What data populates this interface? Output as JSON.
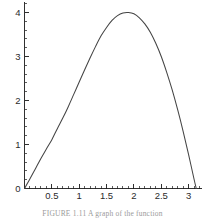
{
  "figure": {
    "caption": "FIGURE 1.11  A graph of the function"
  },
  "chart_data": {
    "type": "line",
    "title": "",
    "subtitle": "",
    "xlabel": "",
    "ylabel": "",
    "grid": false,
    "legend": null,
    "legend_position": "none",
    "line_color": "#444444",
    "axis_color": "#1a1a1a",
    "xlim": [
      0,
      3.25
    ],
    "ylim": [
      0,
      4.25
    ],
    "x_major_ticks": [
      0.5,
      1,
      1.5,
      2,
      2.5,
      3
    ],
    "x_major_tick_labels": [
      "0.5",
      "1",
      "1.5",
      "2",
      "2.5",
      "3"
    ],
    "x_minor_tick_step": 0.1,
    "y_major_ticks": [
      0,
      1,
      2,
      3,
      4
    ],
    "y_major_tick_labels": [
      "0",
      "1",
      "2",
      "3",
      "4"
    ],
    "y_minor_tick_step": 0.2,
    "origin_label": "0",
    "peak": {
      "x": 1.9,
      "y": 4.0
    },
    "zeros": [
      0.0,
      3.14
    ],
    "x": [
      0.0,
      0.1,
      0.2,
      0.3,
      0.4,
      0.5,
      0.6,
      0.7,
      0.8,
      0.9,
      1.0,
      1.1,
      1.2,
      1.3,
      1.4,
      1.5,
      1.6,
      1.7,
      1.8,
      1.9,
      2.0,
      2.1,
      2.2,
      2.3,
      2.4,
      2.5,
      2.6,
      2.7,
      2.8,
      2.9,
      3.0,
      3.1,
      3.14
    ],
    "values": [
      0.0,
      0.22,
      0.45,
      0.68,
      0.9,
      1.11,
      1.36,
      1.6,
      1.86,
      2.14,
      2.42,
      2.7,
      2.97,
      3.23,
      3.47,
      3.66,
      3.82,
      3.93,
      3.99,
      4.0,
      3.97,
      3.88,
      3.74,
      3.55,
      3.3,
      3.0,
      2.64,
      2.24,
      1.79,
      1.3,
      0.77,
      0.21,
      0.0
    ]
  }
}
